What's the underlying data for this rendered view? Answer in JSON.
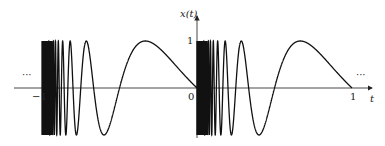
{
  "figure": {
    "y_axis_label": "x(t)",
    "x_axis_label": "t",
    "tick_labels": {
      "neg_one": "−1",
      "zero": "0",
      "one": "1",
      "y_one": "1"
    },
    "ellipsis_left": "···",
    "ellipsis_right": "···"
  },
  "chart_data": {
    "type": "line",
    "title": "",
    "xlabel": "t",
    "ylabel": "x(t)",
    "function": "x(t) = -sin(pi / (t mod 1)), periodic with period 1",
    "x_ticks": [
      -1,
      0,
      1
    ],
    "y_ticks": [
      1
    ],
    "xlim": [
      -1.1,
      1.15
    ],
    "ylim": [
      -1,
      1
    ],
    "periods_shown": [
      [
        -1,
        0
      ],
      [
        0,
        1
      ]
    ],
    "continues_both_directions": true
  }
}
